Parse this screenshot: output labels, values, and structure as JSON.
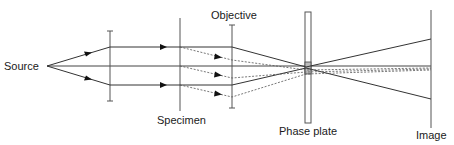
{
  "diagram": {
    "labels": {
      "source": "Source",
      "specimen": "Specimen",
      "objective": "Objective",
      "phase_plate": "Phase plate",
      "image": "Image"
    },
    "components": [
      {
        "name": "source",
        "type": "point",
        "x": 47,
        "y": 66
      },
      {
        "name": "condenser-lens",
        "type": "lens",
        "x": 110,
        "y1": 31,
        "y2": 101
      },
      {
        "name": "specimen",
        "type": "plane",
        "x": 180,
        "y1": 18,
        "y2": 111
      },
      {
        "name": "objective",
        "type": "lens",
        "x": 232,
        "y1": 25,
        "y2": 108
      },
      {
        "name": "phase-plate",
        "type": "plate",
        "x": 305,
        "width": 6,
        "y1": 12,
        "y2": 123
      },
      {
        "name": "image",
        "type": "plane",
        "x": 431,
        "y1": 10,
        "y2": 128
      }
    ],
    "rays": {
      "undiffracted": "solid",
      "diffracted": "dashed"
    },
    "colors": {
      "line": "#333333",
      "background": "#ffffff"
    }
  }
}
